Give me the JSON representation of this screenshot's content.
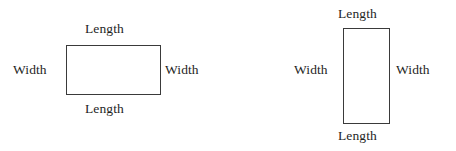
{
  "figure": {
    "background_color": "#ffffff",
    "stroke_color": "#3a3a3a",
    "text_color": "#1f1f1f",
    "diagrams": [
      {
        "id": "horizontal-rectangle",
        "orientation": "horizontal",
        "labels": {
          "top": "Length",
          "bottom": "Length",
          "left": "Width",
          "right": "Width"
        }
      },
      {
        "id": "vertical-rectangle",
        "orientation": "vertical",
        "labels": {
          "top": "Length",
          "bottom": "Length",
          "left": "Width",
          "right": "Width"
        }
      }
    ]
  }
}
